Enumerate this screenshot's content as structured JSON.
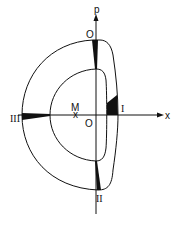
{
  "diagram": {
    "type": "phase-space trajectory",
    "axes": {
      "vertical_label": "p",
      "horizontal_label": "x"
    },
    "labels": {
      "top_origin": "O",
      "center_origin": "O",
      "point_m": "M",
      "region_1": "I",
      "region_2": "II",
      "region_3": "III"
    },
    "colors": {
      "stroke": "#111111",
      "fill": "#111111",
      "background": "#ffffff"
    }
  }
}
